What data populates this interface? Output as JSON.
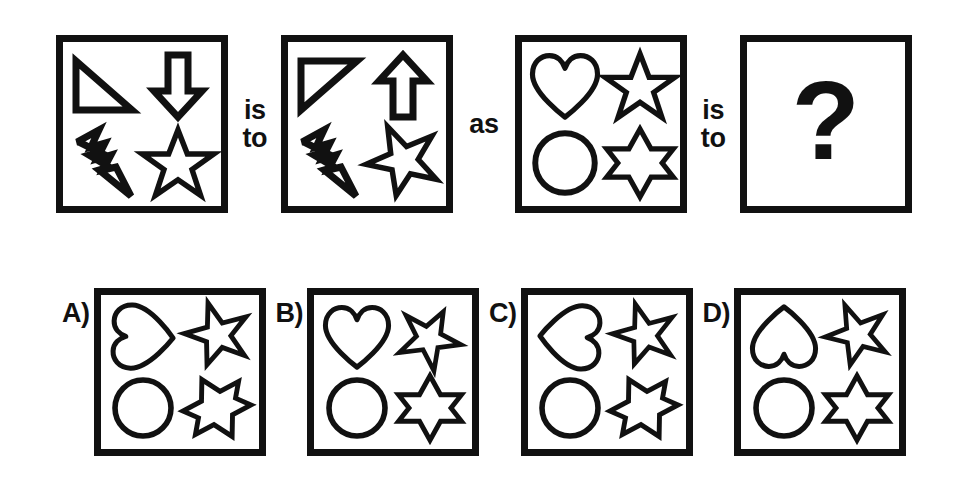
{
  "puzzle": {
    "type": "visual-analogy-multiple-choice",
    "connectors": {
      "first": "is\nto",
      "middle": "as",
      "second": "is\nto"
    },
    "unknown_marker": "?",
    "prompt_panels": [
      {
        "id": "panel-a",
        "position": "first",
        "shapes": [
          {
            "slot": "top-left",
            "name": "right-triangle",
            "orientation": "point-up-left"
          },
          {
            "slot": "top-right",
            "name": "block-arrow",
            "orientation": "down"
          },
          {
            "slot": "bottom-left",
            "name": "lightning-bolt",
            "orientation": "down-right"
          },
          {
            "slot": "bottom-right",
            "name": "five-point-star",
            "orientation": "upright"
          }
        ]
      },
      {
        "id": "panel-b",
        "position": "second",
        "shapes": [
          {
            "slot": "top-left",
            "name": "right-triangle",
            "orientation": "flipped-vertical"
          },
          {
            "slot": "top-right",
            "name": "block-arrow",
            "orientation": "up"
          },
          {
            "slot": "bottom-left",
            "name": "lightning-bolt",
            "orientation": "down-right"
          },
          {
            "slot": "bottom-right",
            "name": "five-point-star",
            "orientation": "flipped-vertical"
          }
        ]
      },
      {
        "id": "panel-c",
        "position": "third",
        "shapes": [
          {
            "slot": "top-left",
            "name": "heart",
            "orientation": "upright"
          },
          {
            "slot": "top-right",
            "name": "five-point-star",
            "orientation": "upright"
          },
          {
            "slot": "bottom-left",
            "name": "circle",
            "orientation": "upright"
          },
          {
            "slot": "bottom-right",
            "name": "six-point-star",
            "orientation": "upright"
          }
        ]
      },
      {
        "id": "panel-question",
        "position": "fourth",
        "shapes": []
      }
    ],
    "options": [
      {
        "id": "option-a",
        "label": "A)",
        "shapes": [
          {
            "slot": "top-left",
            "name": "heart",
            "orientation": "rotated-right"
          },
          {
            "slot": "top-right",
            "name": "five-point-star",
            "orientation": "rotated"
          },
          {
            "slot": "bottom-left",
            "name": "circle",
            "orientation": "upright"
          },
          {
            "slot": "bottom-right",
            "name": "six-point-star",
            "orientation": "rotated"
          }
        ]
      },
      {
        "id": "option-b",
        "label": "B)",
        "shapes": [
          {
            "slot": "top-left",
            "name": "heart",
            "orientation": "upright"
          },
          {
            "slot": "top-right",
            "name": "five-point-star",
            "orientation": "tilted"
          },
          {
            "slot": "bottom-left",
            "name": "circle",
            "orientation": "upright"
          },
          {
            "slot": "bottom-right",
            "name": "six-point-star",
            "orientation": "upright"
          }
        ]
      },
      {
        "id": "option-c",
        "label": "C)",
        "shapes": [
          {
            "slot": "top-left",
            "name": "heart",
            "orientation": "rotated-left"
          },
          {
            "slot": "top-right",
            "name": "five-point-star",
            "orientation": "rotated"
          },
          {
            "slot": "bottom-left",
            "name": "circle",
            "orientation": "upright"
          },
          {
            "slot": "bottom-right",
            "name": "six-point-star",
            "orientation": "rotated"
          }
        ]
      },
      {
        "id": "option-d",
        "label": "D)",
        "shapes": [
          {
            "slot": "top-left",
            "name": "heart",
            "orientation": "flipped-vertical"
          },
          {
            "slot": "top-right",
            "name": "five-point-star",
            "orientation": "flipped-vertical"
          },
          {
            "slot": "bottom-left",
            "name": "circle",
            "orientation": "upright"
          },
          {
            "slot": "bottom-right",
            "name": "six-point-star",
            "orientation": "upright"
          }
        ]
      }
    ]
  },
  "colors": {
    "ink": "#111111",
    "background": "#ffffff"
  }
}
